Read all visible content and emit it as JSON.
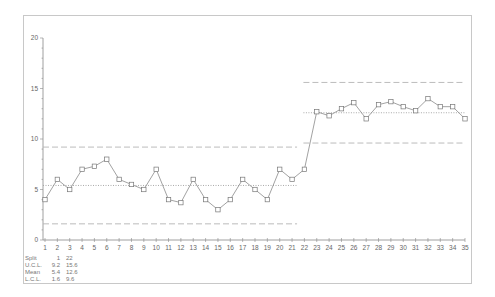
{
  "chart_data": {
    "type": "line",
    "title": "",
    "subtitle": "",
    "xlabel": "",
    "ylabel": "",
    "chart_kind": "individuals control chart with split limits",
    "x": [
      1,
      2,
      3,
      4,
      5,
      6,
      7,
      8,
      9,
      10,
      11,
      12,
      13,
      14,
      15,
      16,
      17,
      18,
      19,
      20,
      21,
      22,
      23,
      24,
      25,
      26,
      27,
      28,
      29,
      30,
      31,
      32,
      33,
      34,
      35
    ],
    "series": [
      {
        "name": "Values",
        "marker": "square",
        "values": [
          4,
          6,
          5,
          7,
          7.3,
          8,
          6,
          5.5,
          5,
          7,
          4,
          3.7,
          6,
          4,
          3,
          4,
          6,
          5,
          4,
          7,
          6,
          7,
          12.7,
          12.3,
          13,
          13.6,
          12,
          13.4,
          13.7,
          13.2,
          12.8,
          14,
          13.2,
          13.2,
          12
        ]
      }
    ],
    "control_limits": [
      {
        "split_start": 1,
        "split_end": 21,
        "ucl": 9.2,
        "mean": 5.4,
        "lcl": 1.6
      },
      {
        "split_start": 22,
        "split_end": 35,
        "ucl": 15.6,
        "mean": 12.6,
        "lcl": 9.6
      }
    ],
    "y_ticks": [
      0,
      5,
      10,
      15,
      20
    ],
    "x_tick_labels": [
      "1",
      "2",
      "3",
      "4",
      "5",
      "6",
      "7",
      "8",
      "9",
      "10",
      "11",
      "12",
      "13",
      "14",
      "15",
      "16",
      "17",
      "18",
      "19",
      "20",
      "21",
      "22",
      "23",
      "24",
      "25",
      "26",
      "27",
      "28",
      "29",
      "30",
      "31",
      "32",
      "33",
      "34",
      "35"
    ],
    "ylim": [
      0,
      20
    ],
    "xlim": [
      1,
      35
    ],
    "grid": false,
    "legend": "none"
  },
  "stats": {
    "rows": [
      {
        "label": "Split",
        "v1": "1",
        "v2": "22"
      },
      {
        "label": "U.C.L.",
        "v1": "9.2",
        "v2": "15.6"
      },
      {
        "label": "Mean",
        "v1": "5.4",
        "v2": "12.6"
      },
      {
        "label": "L.C.L.",
        "v1": "1.6",
        "v2": "9.6"
      }
    ]
  },
  "colors": {
    "line": "#8a8a8a",
    "marker": "#777777",
    "limits": "#b4b4b4",
    "mean": "#a0a0a0",
    "axis": "#888888"
  }
}
